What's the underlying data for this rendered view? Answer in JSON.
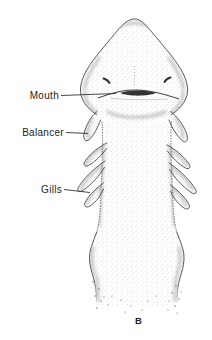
{
  "figure": {
    "labels": {
      "mouth": "Mouth",
      "balancer": "Balancer",
      "gills": "Gills"
    },
    "caption": "B",
    "colors": {
      "background": "#ffffff",
      "ink": "#4a4a4a",
      "text": "#222222"
    }
  }
}
